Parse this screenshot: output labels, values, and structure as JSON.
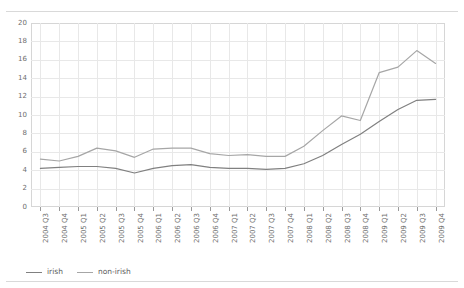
{
  "figure": {
    "clipped_title": "",
    "background": "#ffffff",
    "rule_color": "#d9d9d9"
  },
  "chart_data": {
    "type": "line",
    "title": "",
    "xlabel": "",
    "ylabel": "",
    "ylim": [
      0,
      20
    ],
    "ytick_step": 2,
    "yticks": [
      "20",
      "18",
      "16",
      "14",
      "12",
      "10",
      "8",
      "6",
      "4",
      "2",
      "0"
    ],
    "grid": true,
    "legend_position": "bottom-left",
    "categories": [
      "2004 Q3",
      "2004 Q4",
      "2005 Q1",
      "2005 Q2",
      "2005 Q3",
      "2005 Q4",
      "2006 Q1",
      "2006 Q2",
      "2006 Q3",
      "2006 Q4",
      "2007 Q1",
      "2007 Q2",
      "2007 Q3",
      "2007 Q4",
      "2008 Q1",
      "2008 Q2",
      "2008 Q3",
      "2008 Q4",
      "2009 Q1",
      "2009 Q2",
      "2009 Q3",
      "2009 Q4"
    ],
    "series": [
      {
        "name": "irish",
        "color": "#808080",
        "values": [
          4.2,
          4.3,
          4.4,
          4.4,
          4.2,
          3.7,
          4.2,
          4.5,
          4.6,
          4.3,
          4.2,
          4.2,
          4.1,
          4.2,
          4.7,
          5.6,
          6.8,
          7.9,
          9.3,
          10.6,
          11.6,
          11.7
        ]
      },
      {
        "name": "non-irish",
        "color": "#a6a6a6",
        "values": [
          5.2,
          5.0,
          5.5,
          6.4,
          6.1,
          5.4,
          6.3,
          6.4,
          6.4,
          5.8,
          5.6,
          5.7,
          5.5,
          5.5,
          6.6,
          8.3,
          9.9,
          9.4,
          14.6,
          15.2,
          17.0,
          15.6
        ]
      }
    ]
  },
  "legend": {
    "items": [
      {
        "label": "irish",
        "color": "#808080"
      },
      {
        "label": "non-irish",
        "color": "#a6a6a6"
      }
    ]
  }
}
